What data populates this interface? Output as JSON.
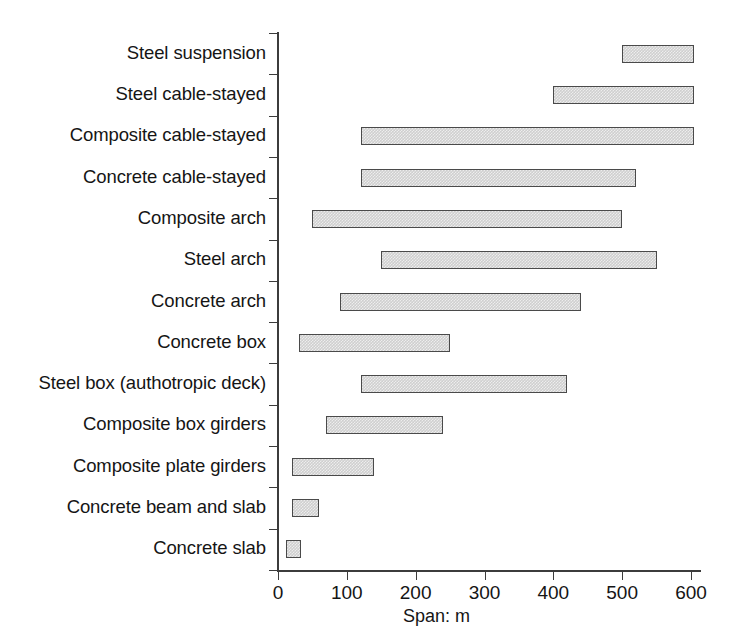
{
  "chart_data": {
    "type": "bar",
    "orientation": "horizontal",
    "subtype": "range-bar",
    "title": "",
    "xlabel": "Span: m",
    "ylabel": "",
    "xlim": [
      0,
      620
    ],
    "xticks": [
      0,
      100,
      200,
      300,
      400,
      500,
      600
    ],
    "xtick_labels": [
      "0",
      "100",
      "200",
      "300",
      "400",
      "500",
      "600"
    ],
    "grid": false,
    "legend": "none",
    "categories": [
      "Steel suspension",
      "Steel cable-stayed",
      "Composite cable-stayed",
      "Concrete cable-stayed",
      "Composite arch",
      "Steel arch",
      "Concrete arch",
      "Concrete box",
      "Steel box (authotropic deck)",
      "Composite box girders",
      "Composite plate girders",
      "Concrete beam and slab",
      "Concrete slab"
    ],
    "ranges": [
      {
        "category": "Steel suspension",
        "start": 500,
        "end": 605
      },
      {
        "category": "Steel cable-stayed",
        "start": 400,
        "end": 605
      },
      {
        "category": "Composite cable-stayed",
        "start": 120,
        "end": 605
      },
      {
        "category": "Concrete cable-stayed",
        "start": 120,
        "end": 520
      },
      {
        "category": "Composite arch",
        "start": 50,
        "end": 500
      },
      {
        "category": "Steel arch",
        "start": 150,
        "end": 550
      },
      {
        "category": "Concrete arch",
        "start": 90,
        "end": 440
      },
      {
        "category": "Concrete box",
        "start": 30,
        "end": 250
      },
      {
        "category": "Steel box (authotropic deck)",
        "start": 120,
        "end": 420
      },
      {
        "category": "Composite box girders",
        "start": 70,
        "end": 240
      },
      {
        "category": "Composite plate girders",
        "start": 20,
        "end": 140
      },
      {
        "category": "Concrete beam and slab",
        "start": 20,
        "end": 60
      },
      {
        "category": "Concrete slab",
        "start": 12,
        "end": 33
      }
    ],
    "colors": {
      "bar_fill": "#cfcfcf",
      "bar_border": "#4a4a4a",
      "axis": "#3c3c3c",
      "text": "#151515",
      "background": "#ffffff"
    }
  }
}
